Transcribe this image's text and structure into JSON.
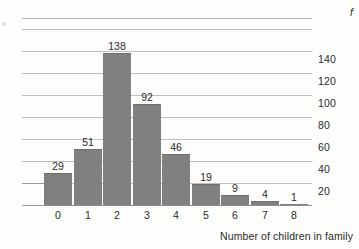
{
  "chart_data": {
    "type": "bar",
    "title": "",
    "subtitle": "",
    "xlabel": "Number of children in family",
    "ylabel": "f",
    "categories": [
      "0",
      "1",
      "2",
      "3",
      "4",
      "5",
      "6",
      "7",
      "8"
    ],
    "values": [
      29,
      51,
      138,
      92,
      46,
      19,
      9,
      4,
      1
    ],
    "value_labels": [
      "29",
      "51",
      "138",
      "92",
      "46",
      "19",
      "9",
      "4",
      "1"
    ],
    "ylim": [
      0,
      170
    ],
    "ytick_values": [
      20,
      40,
      60,
      80,
      100,
      120,
      140
    ],
    "ytick_labels": [
      "20",
      "40",
      "60",
      "80",
      "100",
      "120",
      "140"
    ],
    "gridline_values": [
      20,
      40,
      60,
      80,
      100,
      120,
      140,
      160,
      170
    ],
    "grid": true,
    "grid_axis": "y",
    "legend": "none",
    "legend_position": "none",
    "bar_color": "#808080",
    "gridline_color": "#bfbfbf",
    "axis_color": "#8c8c8c",
    "text_color": "#2b2b2b",
    "background_color": "#fdfdfc",
    "ytick_label_position": "right",
    "ylabel_position": "top-right",
    "xlabel_position": "bottom-right"
  },
  "axis": {
    "y_label": "f",
    "x_title": "Number of children in family"
  }
}
